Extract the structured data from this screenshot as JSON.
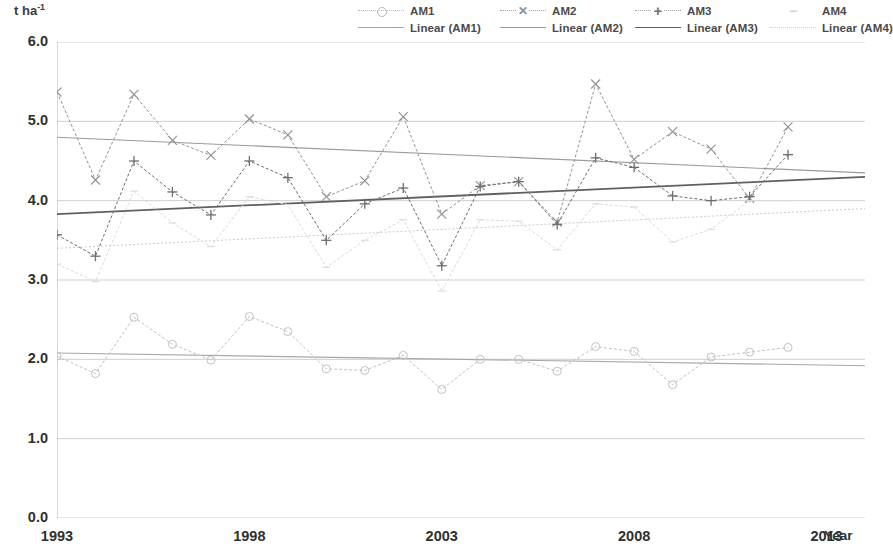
{
  "axes": {
    "y_title": "t ha",
    "y_title_sup": "-1",
    "x_title": "Year",
    "y_ticks": [
      "0.0",
      "1.0",
      "2.0",
      "3.0",
      "4.0",
      "5.0",
      "6.0"
    ],
    "x_ticks": [
      "1993",
      "1998",
      "2003",
      "2008",
      "2013"
    ]
  },
  "legend": {
    "items": [
      {
        "label": "AM1",
        "marker": "circle",
        "line": "dotted",
        "color": "#bdbdbd"
      },
      {
        "label": "AM2",
        "marker": "x",
        "line": "dotted",
        "color": "#8f8f8f"
      },
      {
        "label": "AM3",
        "marker": "plus",
        "line": "solid",
        "color": "#707070"
      },
      {
        "label": "AM4",
        "marker": "dash",
        "line": "dotted",
        "color": "#d2d2d2"
      },
      {
        "label": "Linear (AM1)",
        "marker": "none",
        "line": "solid",
        "color": "#a8a8a8"
      },
      {
        "label": "Linear (AM2)",
        "marker": "none",
        "line": "solid",
        "color": "#9a9a9a"
      },
      {
        "label": "Linear (AM3)",
        "marker": "none",
        "line": "thick",
        "color": "#5f5f5f"
      },
      {
        "label": "Linear (AM4)",
        "marker": "none",
        "line": "dotted",
        "color": "#cfcfcf"
      }
    ]
  },
  "chart_data": {
    "type": "line",
    "title": "",
    "xlabel": "Year",
    "ylabel": "t ha-1",
    "xlim": [
      1993,
      2014
    ],
    "ylim": [
      0.0,
      6.0
    ],
    "grid": true,
    "legend_position": "top",
    "x": [
      1993,
      1994,
      1995,
      1996,
      1997,
      1998,
      1999,
      2000,
      2001,
      2002,
      2003,
      2004,
      2005,
      2006,
      2007,
      2008,
      2009,
      2010,
      2011,
      2012
    ],
    "series": [
      {
        "name": "AM1",
        "marker": "circle",
        "color": "#c2c2c2",
        "values": [
          2.04,
          1.82,
          2.53,
          2.19,
          1.99,
          2.54,
          2.35,
          1.88,
          1.86,
          2.05,
          1.62,
          2.0,
          2.0,
          1.85,
          2.16,
          2.1,
          1.68,
          2.03,
          2.09,
          2.15
        ]
      },
      {
        "name": "AM2",
        "marker": "x",
        "color": "#949494",
        "values": [
          5.37,
          4.26,
          5.34,
          4.76,
          4.57,
          5.03,
          4.83,
          4.05,
          4.25,
          5.06,
          3.83,
          4.19,
          4.24,
          3.73,
          5.47,
          4.52,
          4.87,
          4.65,
          4.03,
          4.93
        ]
      },
      {
        "name": "AM3",
        "marker": "plus",
        "color": "#6e6e6e",
        "values": [
          3.57,
          3.3,
          4.5,
          4.11,
          3.82,
          4.5,
          4.29,
          3.5,
          3.96,
          4.16,
          3.18,
          4.18,
          4.24,
          3.7,
          4.54,
          4.42,
          4.06,
          4.0,
          4.05,
          4.58
        ]
      },
      {
        "name": "AM4",
        "marker": "dash",
        "color": "#dadada",
        "values": [
          3.2,
          2.98,
          4.12,
          3.72,
          3.42,
          4.05,
          3.95,
          3.16,
          3.5,
          3.76,
          2.86,
          3.76,
          3.74,
          3.38,
          3.96,
          3.92,
          3.48,
          3.64,
          4.0,
          4.0
        ]
      }
    ],
    "trendlines": [
      {
        "name": "Linear (AM1)",
        "color": "#a8a8a8",
        "style": "solid",
        "x0": 1993,
        "y0": 2.08,
        "x1": 2014,
        "y1": 1.92
      },
      {
        "name": "Linear (AM2)",
        "color": "#9a9a9a",
        "style": "solid",
        "x0": 1993,
        "y0": 4.8,
        "x1": 2014,
        "y1": 4.35
      },
      {
        "name": "Linear (AM3)",
        "color": "#5f5f5f",
        "style": "thick",
        "x0": 1993,
        "y0": 3.83,
        "x1": 2014,
        "y1": 4.3
      },
      {
        "name": "Linear (AM4)",
        "color": "#cfcfcf",
        "style": "dotted",
        "x0": 1993,
        "y0": 3.4,
        "x1": 2014,
        "y1": 3.9
      }
    ]
  }
}
